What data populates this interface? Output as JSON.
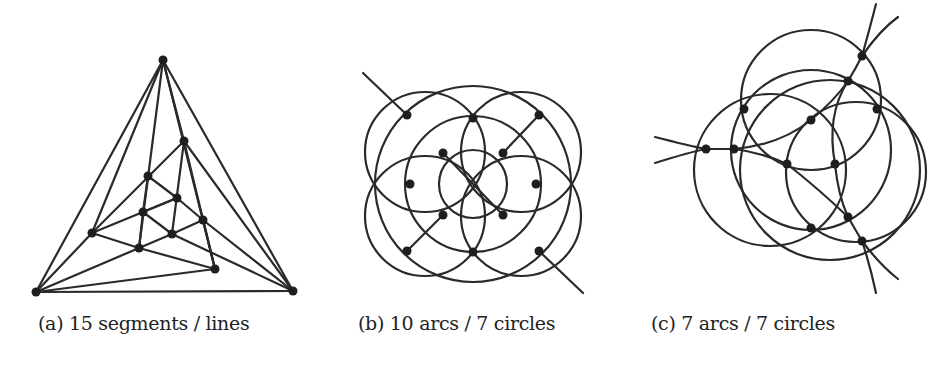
{
  "figure": {
    "panels": [
      {
        "id": "a",
        "caption": "(a) 15 segments / lines",
        "caption_x": 24,
        "vertices": [
          [
            163,
            60
          ],
          [
            36,
            292
          ],
          [
            293,
            291
          ],
          [
            184,
            141
          ],
          [
            148,
            176
          ],
          [
            177,
            198
          ],
          [
            143,
            212
          ],
          [
            203,
            220
          ],
          [
            172,
            234
          ],
          [
            92,
            233
          ],
          [
            139,
            248
          ],
          [
            215,
            269
          ]
        ],
        "segments": [
          [
            [
              163,
              60
            ],
            [
              36,
              292
            ]
          ],
          [
            [
              163,
              60
            ],
            [
              293,
              291
            ]
          ],
          [
            [
              36,
              292
            ],
            [
              293,
              291
            ]
          ],
          [
            [
              163,
              60
            ],
            [
              92,
              233
            ]
          ],
          [
            [
              163,
              60
            ],
            [
              139,
              248
            ]
          ],
          [
            [
              163,
              60
            ],
            [
              215,
              269
            ]
          ],
          [
            [
              163,
              60
            ],
            [
              184,
              141
            ]
          ],
          [
            [
              36,
              292
            ],
            [
              92,
              233
            ]
          ],
          [
            [
              36,
              292
            ],
            [
              139,
              248
            ]
          ],
          [
            [
              36,
              292
            ],
            [
              215,
              269
            ]
          ],
          [
            [
              293,
              291
            ],
            [
              184,
              141
            ]
          ],
          [
            [
              293,
              291
            ],
            [
              203,
              220
            ]
          ],
          [
            [
              293,
              291
            ],
            [
              172,
              234
            ]
          ],
          [
            [
              92,
              233
            ],
            [
              184,
              141
            ]
          ],
          [
            [
              92,
              233
            ],
            [
              177,
              198
            ]
          ],
          [
            [
              92,
              233
            ],
            [
              139,
              248
            ]
          ],
          [
            [
              139,
              248
            ],
            [
              215,
              269
            ]
          ],
          [
            [
              139,
              248
            ],
            [
              143,
              212
            ]
          ],
          [
            [
              139,
              248
            ],
            [
              172,
              234
            ]
          ],
          [
            [
              184,
              141
            ],
            [
              172,
              234
            ]
          ],
          [
            [
              184,
              141
            ],
            [
              215,
              269
            ]
          ],
          [
            [
              148,
              176
            ],
            [
              143,
              212
            ]
          ],
          [
            [
              148,
              176
            ],
            [
              177,
              198
            ]
          ],
          [
            [
              177,
              198
            ],
            [
              203,
              220
            ]
          ],
          [
            [
              143,
              212
            ],
            [
              177,
              198
            ]
          ],
          [
            [
              143,
              212
            ],
            [
              172,
              234
            ]
          ],
          [
            [
              172,
              234
            ],
            [
              203,
              220
            ]
          ],
          [
            [
              203,
              220
            ],
            [
              215,
              269
            ]
          ]
        ]
      },
      {
        "id": "b",
        "caption": "(b) 10 arcs / 7 circles",
        "caption_x": 203,
        "vertices": [
          [
            407,
            115
          ],
          [
            473,
            118
          ],
          [
            539,
            115
          ],
          [
            443,
            153
          ],
          [
            503,
            153
          ],
          [
            410,
            184
          ],
          [
            536,
            184
          ],
          [
            443,
            215
          ],
          [
            503,
            215
          ],
          [
            407,
            251
          ],
          [
            473,
            252
          ],
          [
            539,
            251
          ]
        ],
        "circles": [
          {
            "cx": 473,
            "cy": 184,
            "r": 98
          },
          {
            "cx": 473,
            "cy": 184,
            "r": 34
          },
          {
            "cx": 425,
            "cy": 152,
            "r": 60
          },
          {
            "cx": 521,
            "cy": 152,
            "r": 60
          },
          {
            "cx": 425,
            "cy": 216,
            "r": 60
          },
          {
            "cx": 521,
            "cy": 216,
            "r": 60
          },
          {
            "cx": 473,
            "cy": 184,
            "r": 68
          }
        ],
        "segments": [
          [
            [
              363,
              73
            ],
            [
              407,
              115
            ]
          ],
          [
            [
              539,
              115
            ],
            [
              503,
              153
            ]
          ],
          [
            [
              443,
              153
            ],
            [
              503,
              215
            ]
          ],
          [
            [
              443,
              215
            ],
            [
              407,
              251
            ]
          ],
          [
            [
              539,
              251
            ],
            [
              583,
              293
            ]
          ]
        ]
      },
      {
        "id": "c",
        "caption": "(c) 7 arcs / 7 circles",
        "caption_x": 382,
        "vertices": [
          [
            862,
            56
          ],
          [
            848,
            81
          ],
          [
            744,
            109
          ],
          [
            877,
            109
          ],
          [
            811,
            120
          ],
          [
            706,
            149
          ],
          [
            734,
            149
          ],
          [
            787,
            164
          ],
          [
            835,
            164
          ],
          [
            848,
            217
          ],
          [
            811,
            228
          ],
          [
            862,
            241
          ]
        ],
        "circles": [
          {
            "cx": 811,
            "cy": 100,
            "r": 70
          },
          {
            "cx": 811,
            "cy": 150,
            "r": 80
          },
          {
            "cx": 770,
            "cy": 170,
            "r": 76
          },
          {
            "cx": 856,
            "cy": 172,
            "r": 70
          },
          {
            "cx": 830,
            "cy": 170,
            "r": 90
          }
        ],
        "curves": [
          "M655,137 Q690,146 706,149",
          "M655,163 Q690,152 706,149",
          "M706,149 L734,149",
          "M734,149 Q780,145 811,120",
          "M734,149 Q760,152 787,164",
          "M811,120 Q835,100 848,81",
          "M848,81 Q856,68 862,56",
          "M862,56 Q868,35 876,4",
          "M862,56 Q880,30 898,17",
          "M848,81 Q826,115 835,164",
          "M787,164 Q820,190 848,217",
          "M835,164 Q838,195 848,217",
          "M848,217 L862,241",
          "M862,241 Q870,265 876,293",
          "M862,241 Q880,265 898,279"
        ]
      }
    ],
    "vertex_radius": 4.5,
    "stroke_color": "#2a2a2a",
    "vertex_color": "#1e1e1e"
  },
  "captions": {
    "a": "(a) 15 segments / lines",
    "b": "(b) 10 arcs / 7 circles",
    "c": "(c) 7 arcs / 7 circles"
  }
}
